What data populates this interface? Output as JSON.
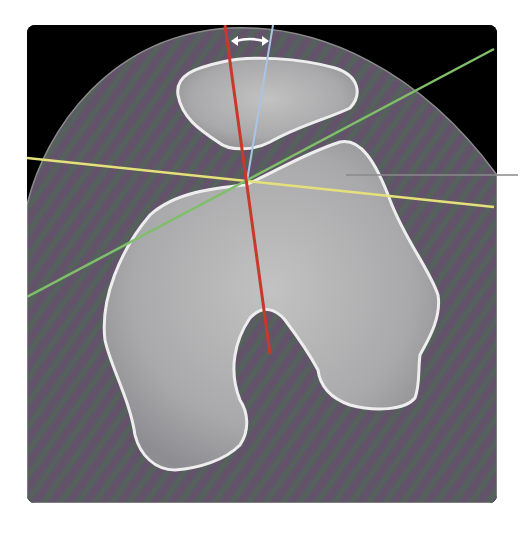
{
  "figure": {
    "type": "axial CT slice",
    "background_color": "#000000",
    "soft_tissue_color": "#5e5a66",
    "bone_color": "#b8b8b8",
    "cortex_color": "#eeeeee"
  },
  "caption": {
    "ghost_text": ""
  },
  "annotations": {
    "lines": [
      {
        "name": "red-axis-line",
        "color": "#c8392b",
        "x1": 225,
        "y1": 25,
        "x2": 270,
        "y2": 354
      },
      {
        "name": "blue-axis-line",
        "color": "#a9c4e6",
        "x1": 273,
        "y1": 25,
        "x2": 247,
        "y2": 181
      },
      {
        "name": "yellow-transverse-line",
        "color": "#e6e07a",
        "x1": 27,
        "y1": 158,
        "x2": 494,
        "y2": 207
      },
      {
        "name": "green-oblique-line",
        "color": "#7fbf6a",
        "x1": 27,
        "y1": 297,
        "x2": 494,
        "y2": 49
      }
    ],
    "angle_arrow": {
      "color": "#ffffff",
      "x1": 231,
      "y1": 40,
      "x2": 269,
      "y2": 40
    },
    "pointer_line": {
      "color": "#777777",
      "x1": 346,
      "y1": 175,
      "x2": 518,
      "y2": 175
    }
  }
}
